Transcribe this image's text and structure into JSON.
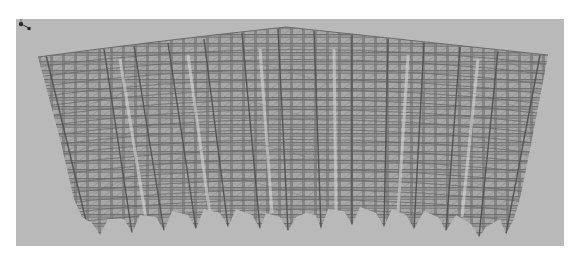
{
  "viewport": {
    "background": "#b9b9b9",
    "outer_background": "#ffffff"
  },
  "model": {
    "type": "structural-wireframe",
    "shape": "curved-fan-frame",
    "bays": 14,
    "stories": 18,
    "line_color": "#5a5a5a",
    "fill_color": "#8f8f8f",
    "highlight_column_color": "#d4d4d4"
  },
  "axis_triad": {
    "icon": "axis-triad-icon"
  }
}
